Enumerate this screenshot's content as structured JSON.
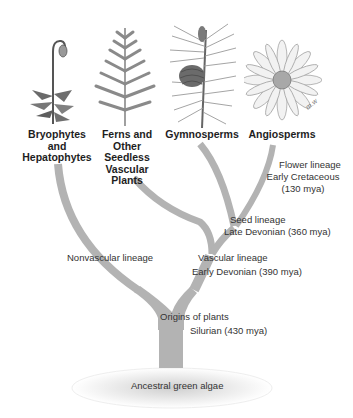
{
  "diagram": {
    "type": "phylogenetic-tree",
    "root": "Ancestral green algae",
    "groups": [
      {
        "id": "bryophytes",
        "label": "Bryophytes\nand\nHepatophytes",
        "illustration": "moss-icon"
      },
      {
        "id": "ferns",
        "label": "Ferns and\nOther\nSeedless\nVascular\nPlants",
        "illustration": "fern-icon"
      },
      {
        "id": "gymnosperms",
        "label": "Gymnosperms",
        "illustration": "pine-cone-icon"
      },
      {
        "id": "angiosperms",
        "label": "Angiosperms",
        "illustration": "daisy-flower-icon"
      }
    ],
    "nodes": {
      "origins": {
        "line1": "Origins of plants",
        "line2": "Silurian (430 mya)"
      },
      "nonvascular": {
        "line1": "Nonvascular lineage"
      },
      "vascular": {
        "line1": "Vascular lineage",
        "line2": "Early Devonian (390 mya)"
      },
      "seed": {
        "line1": "Seed lineage",
        "line2": "Late Devonian (360 mya)"
      },
      "flower": {
        "line1": "Flower lineage",
        "line2": "Early Cretaceous",
        "line3": "(130 mya)"
      }
    },
    "artist_signature": "m.w",
    "colors": {
      "branch": "#b3b3b3",
      "branch_edge": "#9e9e9e",
      "text": "#333333",
      "label": "#1e1e1e"
    }
  }
}
